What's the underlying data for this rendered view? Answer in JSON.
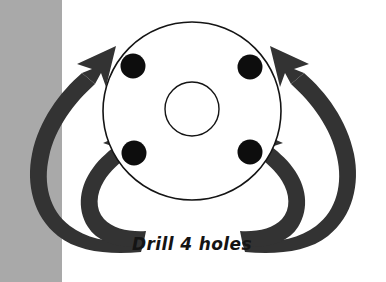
{
  "canvas": {
    "width": 386,
    "height": 282,
    "background_color": "#ffffff"
  },
  "panels": {
    "left_gray_band": {
      "name": "left-gray-band",
      "color": "#a9a9a9",
      "x": 0,
      "y": 0,
      "width": 62,
      "height": 282
    }
  },
  "diagram": {
    "title": "Drill 4 holes",
    "annotation_label": "Drill 4 holes",
    "stroke_color": "#141414",
    "fill_color": "#ffffff",
    "hole_color": "#0d0d0d",
    "arrow_color": "#333333",
    "flange_outer_circle": {
      "name": "flange-outer-circle",
      "cx": 192,
      "cy": 111,
      "r": 89,
      "stroke_width": 1.6
    },
    "flange_bore_circle": {
      "name": "flange-bore-circle",
      "cx": 192,
      "cy": 109,
      "r": 27,
      "stroke_width": 1.4
    },
    "bolt_hole_count": 4,
    "bolt_hole_radius": 12.5,
    "bolt_holes": [
      {
        "name": "bolt-hole-top-left",
        "cx": 133,
        "cy": 66
      },
      {
        "name": "bolt-hole-top-right",
        "cx": 250,
        "cy": 67
      },
      {
        "name": "bolt-hole-bottom-left",
        "cx": 134,
        "cy": 153
      },
      {
        "name": "bolt-hole-bottom-right",
        "cx": 250,
        "cy": 152
      }
    ],
    "arrows": [
      {
        "name": "arrow-outer-left",
        "points_to": "bolt-hole-top-left"
      },
      {
        "name": "arrow-outer-right",
        "points_to": "bolt-hole-top-right"
      },
      {
        "name": "arrow-inner-left",
        "points_to": "bolt-hole-bottom-left"
      },
      {
        "name": "arrow-inner-right",
        "points_to": "bolt-hole-bottom-right"
      }
    ],
    "label_position": {
      "x": 192,
      "y": 250
    }
  }
}
